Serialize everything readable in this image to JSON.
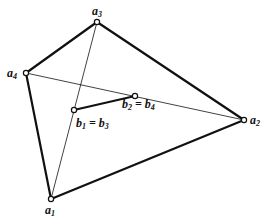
{
  "diagram": {
    "type": "quadrilateral-with-diagonals",
    "vertices": [
      {
        "id": "a1",
        "label": "a",
        "sub": "1",
        "x": 51,
        "y": 199,
        "lx": 45,
        "ly": 214
      },
      {
        "id": "a2",
        "label": "a",
        "sub": "2",
        "x": 244,
        "y": 120,
        "lx": 250,
        "ly": 124
      },
      {
        "id": "a3",
        "label": "a",
        "sub": "3",
        "x": 97,
        "y": 22,
        "lx": 92,
        "ly": 15
      },
      {
        "id": "a4",
        "label": "a",
        "sub": "4",
        "x": 26,
        "y": 73,
        "lx": 7,
        "ly": 77
      }
    ],
    "inner_points": [
      {
        "id": "b1b3",
        "label_parts": [
          "b",
          "1",
          " = ",
          "b",
          "3"
        ],
        "x": 74,
        "y": 110,
        "lx": 76,
        "ly": 127
      },
      {
        "id": "b2b4",
        "label_parts": [
          "b",
          "2",
          " = ",
          "b",
          "4"
        ],
        "x": 135,
        "y": 96,
        "lx": 122,
        "ly": 108
      }
    ],
    "thick_edges": [
      [
        "a3",
        "a2"
      ],
      [
        "a3",
        "a4"
      ],
      [
        "a4",
        "a1"
      ],
      [
        "a1",
        "a2"
      ],
      [
        "b1b3",
        "b2b4"
      ]
    ],
    "thin_edges": [
      [
        "a3",
        "a1"
      ],
      [
        "a4",
        "a2"
      ]
    ],
    "colors": {
      "stroke": "#111111",
      "background": "#ffffff"
    }
  }
}
